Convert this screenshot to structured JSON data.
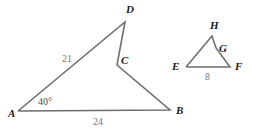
{
  "figure": {
    "background_color": "#ffffff",
    "stroke_color": "#6e6e6e",
    "vertex_label_color": "#1a1a1a",
    "measure_label_color": "#767676",
    "angle_label_color": "#4a4a4a"
  },
  "large_triangle": {
    "name": "triangle-ABCD",
    "path": "18,111 125,22 117,65 170,110 18,111",
    "vertices": [
      {
        "id": "A",
        "label": "A",
        "x": 18,
        "y": 111,
        "label_x": 8,
        "label_y": 117
      },
      {
        "id": "D",
        "label": "D",
        "x": 125,
        "y": 22,
        "label_x": 126,
        "label_y": 13
      },
      {
        "id": "C",
        "label": "C",
        "x": 117,
        "y": 65,
        "label_x": 121,
        "label_y": 64
      },
      {
        "id": "B",
        "label": "B",
        "x": 170,
        "y": 110,
        "label_x": 176,
        "label_y": 114
      }
    ],
    "side_labels": [
      {
        "id": "AD",
        "text": "21",
        "x": 62,
        "y": 62
      },
      {
        "id": "AB",
        "text": "24",
        "x": 93,
        "y": 125
      }
    ],
    "angle_labels": [
      {
        "id": "angle-A",
        "text": "40°",
        "x": 38,
        "y": 105
      }
    ]
  },
  "small_triangle": {
    "name": "triangle-EFGH",
    "path": "186,67 212,36 216,48 230,67 186,67",
    "vertices": [
      {
        "id": "E",
        "label": "E",
        "x": 186,
        "y": 67,
        "label_x": 172,
        "label_y": 70
      },
      {
        "id": "H",
        "label": "H",
        "x": 212,
        "y": 36,
        "label_x": 210,
        "label_y": 29
      },
      {
        "id": "G",
        "label": "G",
        "x": 216,
        "y": 48,
        "label_x": 219,
        "label_y": 52
      },
      {
        "id": "F",
        "label": "F",
        "x": 230,
        "y": 67,
        "label_x": 235,
        "label_y": 70
      }
    ],
    "side_labels": [
      {
        "id": "EF",
        "text": "8",
        "x": 205,
        "y": 80
      }
    ],
    "angle_labels": []
  }
}
